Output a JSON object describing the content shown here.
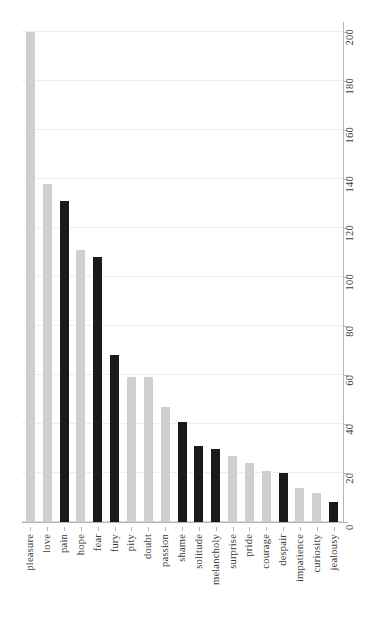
{
  "chart_data": {
    "type": "bar",
    "title": "",
    "subtitle": "",
    "xlabel": "",
    "ylabel": "",
    "ylim": [
      0,
      200
    ],
    "yticks": [
      0,
      20,
      40,
      60,
      80,
      100,
      120,
      140,
      160,
      180,
      200
    ],
    "ytick_labels": [
      "0",
      "20",
      "40",
      "60",
      "80",
      "100",
      "120",
      "140",
      "160",
      "180",
      "200"
    ],
    "y_axis_position": "right",
    "grid": true,
    "grid_axis": "y",
    "legend": "none",
    "categories": [
      "pleasure",
      "love",
      "pain",
      "hope",
      "fear",
      "fury",
      "pity",
      "doubt",
      "passion",
      "shame",
      "solitude",
      "melancholy",
      "surprise",
      "pride",
      "courage",
      "despair",
      "impatience",
      "curiosity",
      "jealousy"
    ],
    "values": [
      200,
      138,
      131,
      111,
      108,
      68,
      59,
      59,
      47,
      41,
      31,
      30,
      27,
      24,
      21,
      20,
      14,
      12,
      8
    ],
    "bar_colors": [
      "light",
      "light",
      "dark",
      "light",
      "dark",
      "dark",
      "light",
      "light",
      "light",
      "dark",
      "dark",
      "dark",
      "light",
      "light",
      "light",
      "dark",
      "light",
      "light",
      "dark"
    ],
    "colors": {
      "dark": "#1a1a1a",
      "light": "#cfcfcf",
      "grid": "#ededed",
      "axis": "#b5b5b5",
      "text": "#3a3a3a",
      "background": "#ffffff"
    },
    "tick_label_orientation": "vertical",
    "category_label_orientation": "vertical"
  }
}
